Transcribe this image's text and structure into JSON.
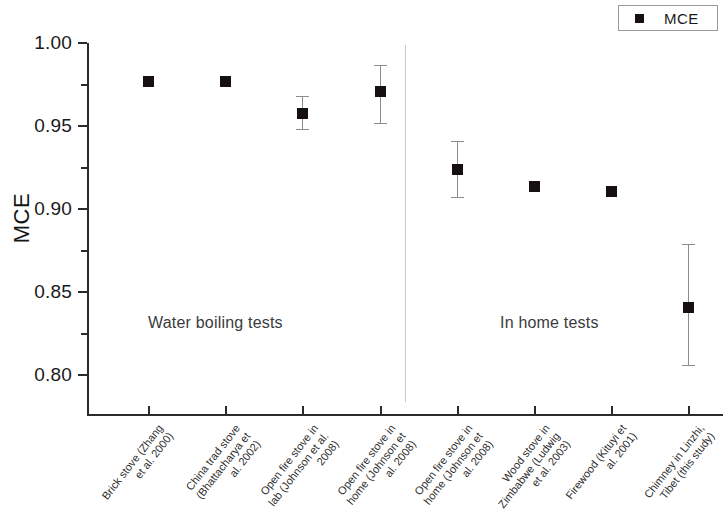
{
  "legend": {
    "entries": [
      {
        "label": "MCE",
        "marker": "filled-square",
        "color": "#171013"
      }
    ],
    "position": "top-right"
  },
  "annotations": [
    {
      "text": "Water boiling tests",
      "x": 148,
      "y": 314
    },
    {
      "text": "In home tests",
      "x": 500,
      "y": 314
    }
  ],
  "chart_data": {
    "type": "scatter",
    "title": "",
    "subtitle": "",
    "xlabel": "",
    "ylabel": "MCE",
    "ylim": [
      0.78,
      1.005
    ],
    "yticks": [
      1.0,
      0.95,
      0.9,
      0.85,
      0.8
    ],
    "ytick_labels": [
      "1.00",
      "0.95",
      "0.90",
      "0.85",
      "0.80"
    ],
    "yminor_ticks": [
      0.975,
      0.925,
      0.875,
      0.825
    ],
    "grid": false,
    "legend_position": "top-right",
    "categories": [
      "Brick stove (Zhang et al. 2000)",
      "China trad stove (Bhattacharya et al. 2002)",
      "Open fire stove in lab (Johnson et al. 2008)",
      "Open fire stove in home (Johnson et al. 2008)",
      "Open fire stove in home (Johnson et al. 2008)",
      "Wood stove in Zimbabwe (Ludwig et al. 2003)",
      "Firewood (Kituyi et al. 2001)",
      "Chimney in Linzhi, Tibet (this study)"
    ],
    "category_lines": [
      [
        "Brick stove (Zhang",
        "et al. 2000)"
      ],
      [
        "China trad stove",
        "(Bhattacharya et",
        "al. 2002)"
      ],
      [
        "Open fire stove in",
        "lab (Johnson et al.",
        "2008)"
      ],
      [
        "Open fire stove in",
        "home (Johnson et",
        "al. 2008)"
      ],
      [
        "Open fire stove in",
        "home (Johnson et",
        "al. 2008)"
      ],
      [
        "Wood stove in",
        "Zimbabwe (Ludwig",
        "et al. 2003)"
      ],
      [
        "Firewood (Kituyi et",
        "al. 2001)"
      ],
      [
        "Chimney in Linzhi,",
        "Tibet (this study)"
      ]
    ],
    "series": [
      {
        "name": "MCE",
        "color": "#171013",
        "values": [
          0.977,
          0.977,
          0.958,
          0.971,
          0.924,
          0.914,
          0.911,
          0.841
        ],
        "err_low": [
          null,
          null,
          0.948,
          0.952,
          0.907,
          null,
          null,
          0.806
        ],
        "err_high": [
          null,
          null,
          0.968,
          0.987,
          0.941,
          null,
          null,
          0.879
        ]
      }
    ],
    "groups": [
      {
        "name": "Water boiling tests",
        "members": [
          0,
          1,
          2,
          3
        ]
      },
      {
        "name": "In home tests",
        "members": [
          4,
          5,
          6,
          7
        ]
      }
    ],
    "group_divider_after_index": 3
  }
}
